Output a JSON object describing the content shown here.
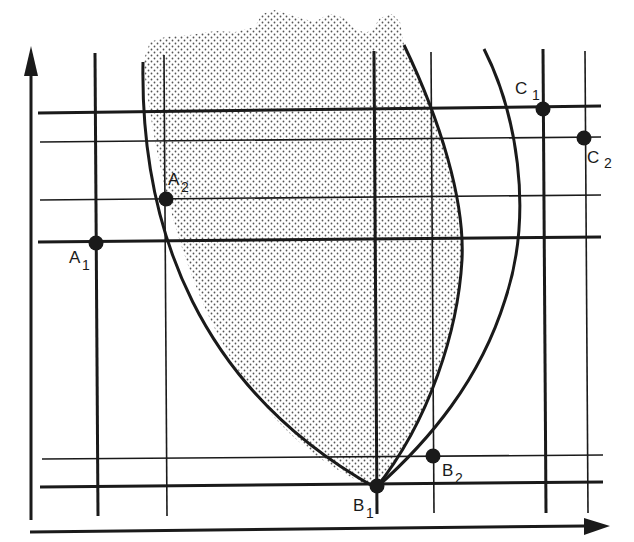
{
  "diagram": {
    "type": "coordinate grid with feasible region",
    "colors": {
      "ink": "#1a1a1a",
      "shade_dot": "#555555",
      "background": "#ffffff"
    },
    "axes": {
      "x_axis": {
        "has_arrow": true,
        "label": ""
      },
      "y_axis": {
        "has_arrow": true,
        "label": ""
      }
    },
    "regions": [
      {
        "name": "shaded-region",
        "fill": "stippled dots",
        "bounded_by": [
          "left-curve",
          "inner-right-curve",
          "wavy-top-edge"
        ]
      }
    ],
    "curves": [
      {
        "name": "left-curve",
        "description": "concave boundary from top-left down to B1"
      },
      {
        "name": "inner-right-curve",
        "description": "convex boundary from top down to B1"
      },
      {
        "name": "outer-right-curve",
        "description": "arc from top-right down to B1"
      }
    ],
    "points": [
      {
        "id": "A1",
        "label": "A",
        "sub": "1"
      },
      {
        "id": "A2",
        "label": "A",
        "sub": "2"
      },
      {
        "id": "B1",
        "label": "B",
        "sub": "1"
      },
      {
        "id": "B2",
        "label": "B",
        "sub": "2"
      },
      {
        "id": "C1",
        "label": "C",
        "sub": "1"
      },
      {
        "id": "C2",
        "label": "C",
        "sub": "2"
      }
    ]
  }
}
